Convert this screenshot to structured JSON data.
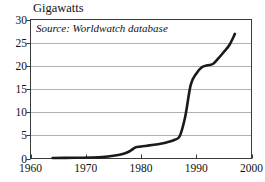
{
  "chart_data": {
    "type": "line",
    "title": "Gigawatts",
    "xlabel": "",
    "ylabel": "Gigawatts",
    "annotation": "Source: Worldwatch database",
    "grid": true,
    "legend": "none",
    "xlim": [
      1960,
      2000
    ],
    "ylim": [
      0,
      30
    ],
    "xticks": [
      1960,
      1970,
      1980,
      1990,
      2000
    ],
    "yticks": [
      0,
      5,
      10,
      15,
      20,
      25,
      30
    ],
    "xtick_labels": [
      "1960",
      "1970",
      "1980",
      "1990",
      "2000"
    ],
    "ytick_labels": [
      "0",
      "5",
      "10",
      "15",
      "20",
      "25",
      "30"
    ],
    "line_color": "#1a1a1a",
    "grid_color": "#b0b0b0",
    "frame_color": "#3a3a3a",
    "series": [
      {
        "name": "Installed capacity",
        "x": [
          1964,
          1968,
          1971,
          1973,
          1975,
          1977,
          1978,
          1979,
          1980,
          1982,
          1984,
          1985,
          1986,
          1987,
          1988,
          1989,
          1990,
          1991,
          1992,
          1993,
          1994,
          1995,
          1996,
          1997
        ],
        "values": [
          0.1,
          0.15,
          0.2,
          0.3,
          0.6,
          1.1,
          1.6,
          2.4,
          2.6,
          2.9,
          3.3,
          3.6,
          4.0,
          4.8,
          9.0,
          15.9,
          18.3,
          19.7,
          20.1,
          20.4,
          21.6,
          23.0,
          24.5,
          26.9
        ]
      }
    ]
  }
}
